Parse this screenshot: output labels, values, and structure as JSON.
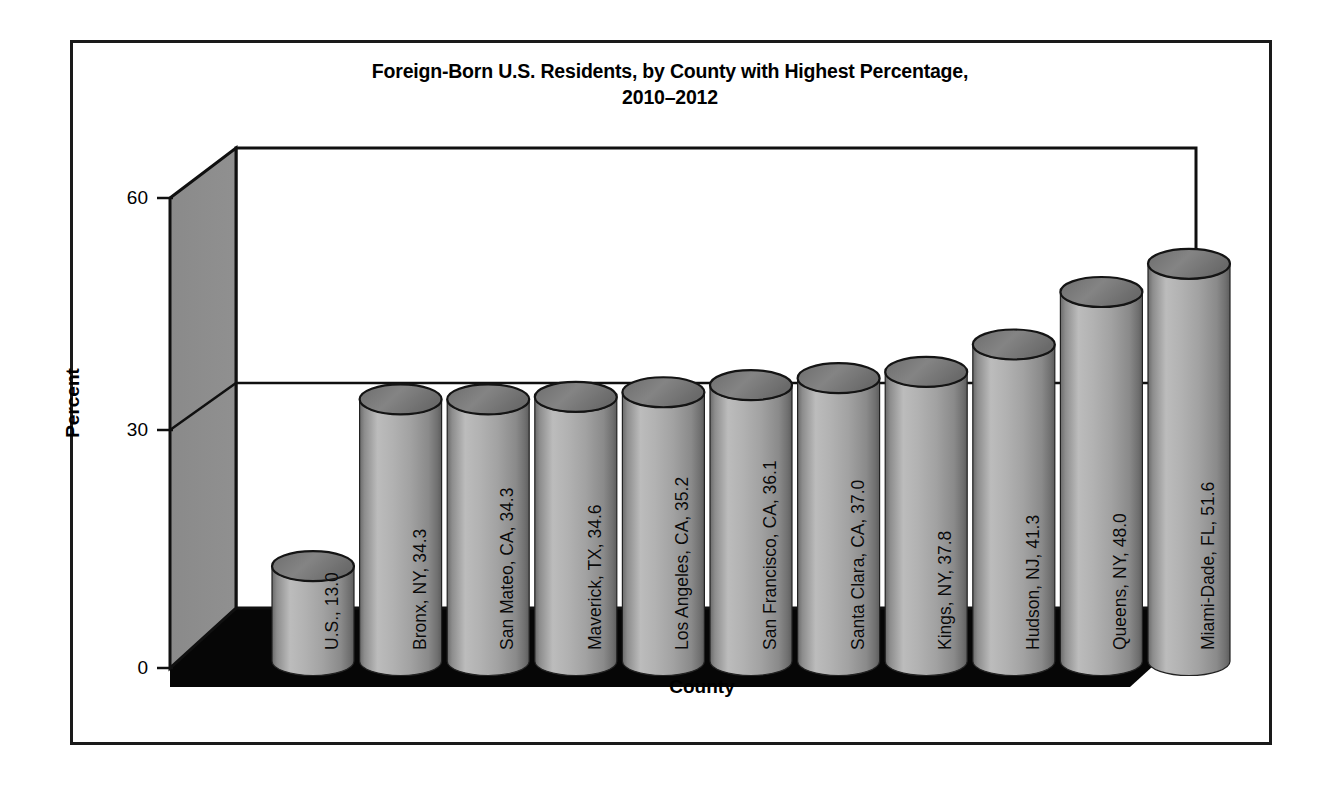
{
  "chart_data": {
    "type": "bar",
    "title": "Foreign-Born U.S. Residents, by County with Highest Percentage, 2010–2012",
    "title_line1": "Foreign-Born U.S. Residents, by County with Highest Percentage,",
    "title_line2": "2010–2012",
    "xlabel": "County",
    "ylabel": "Percent",
    "ylim": [
      0,
      60
    ],
    "yticks": [
      0,
      30,
      60
    ],
    "ytick_labels": [
      "0",
      "30",
      "60"
    ],
    "grid": true,
    "legend": null,
    "style": "3d-cylinder",
    "categories": [
      "U.S.",
      "Bronx, NY",
      "San Mateo, CA",
      "Maverick, TX",
      "Los Angeles, CA",
      "San Francisco, CA",
      "Santa Clara, CA",
      "Kings, NY",
      "Hudson, NJ",
      "Queens, NY",
      "Miami-Dade, FL"
    ],
    "values": [
      13.0,
      34.3,
      34.3,
      34.6,
      35.2,
      36.1,
      37.0,
      37.8,
      41.3,
      48.0,
      51.6
    ],
    "bar_labels": [
      "U.S., 13.0",
      "Bronx, NY, 34.3",
      "San Mateo, CA, 34.3",
      "Maverick, TX, 34.6",
      "Los Angeles, CA, 35.2",
      "San Francisco, CA, 36.1",
      "Santa Clara, CA, 37.0",
      "Kings, NY, 37.8",
      "Hudson, NJ, 41.3",
      "Queens, NY, 48.0",
      "Miami-Dade, FL, 51.6"
    ]
  },
  "colors": {
    "bar_light": "#b9b9b9",
    "bar_mid": "#9a9a9a",
    "bar_dark": "#6e6e6e",
    "bar_top": "#7a7a7a",
    "side_wall": "#8c8c8c",
    "back_wall": "#ffffff",
    "floor": "#050505",
    "outline": "#101010",
    "text": "#000000"
  }
}
